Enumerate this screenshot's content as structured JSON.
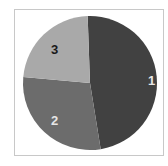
{
  "chart_data": {
    "type": "pie",
    "title": "",
    "categories": [
      "1",
      "2",
      "3"
    ],
    "values": [
      48,
      29,
      23
    ],
    "colors": [
      "#414141",
      "#6c6c6c",
      "#a9a9a9"
    ],
    "label_colors": [
      "#e6e6e6",
      "#e6e6e6",
      "#1a1a1a"
    ],
    "start_angle_deg": -2,
    "direction": "clockwise",
    "legend": "none"
  },
  "labels": {
    "s1": "1",
    "s2": "2",
    "s3": "3"
  }
}
